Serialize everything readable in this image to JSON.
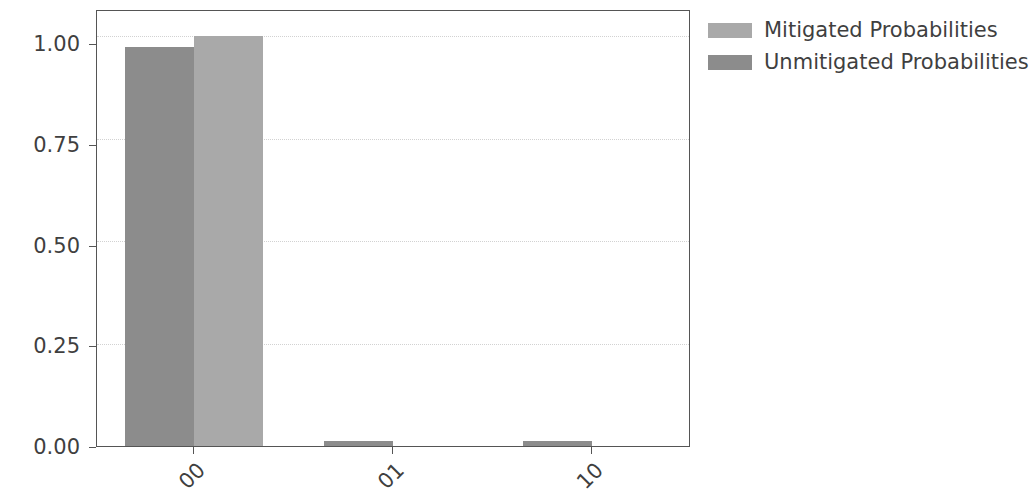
{
  "chart": {
    "ylabel": "Quasi-probability",
    "xlabel": "",
    "title": ""
  },
  "axis": {
    "yticks": [
      "0.00",
      "0.25",
      "0.50",
      "0.75",
      "1.00"
    ],
    "xticks": [
      "00",
      "01",
      "10"
    ]
  },
  "legend": {
    "entries": [
      {
        "label": "Mitigated Probabilities",
        "color": "#a9a9a9"
      },
      {
        "label": "Unmitigated Probabilities",
        "color": "#8c8c8c"
      }
    ]
  },
  "chart_data": {
    "type": "bar",
    "title": "",
    "xlabel": "",
    "ylabel": "Quasi-probability",
    "categories": [
      "00",
      "01",
      "10"
    ],
    "series": [
      {
        "name": "Unmitigated Probabilities",
        "color": "#8c8c8c",
        "values": [
          0.975,
          0.012,
          0.012
        ]
      },
      {
        "name": "Mitigated Probabilities",
        "color": "#a9a9a9",
        "values": [
          1.0,
          0.0,
          0.0
        ]
      }
    ],
    "ylim": [
      0.0,
      1.062
    ],
    "yticks": [
      0.0,
      0.25,
      0.5,
      0.75,
      1.0
    ],
    "grid": "y-axis dotted light gray",
    "legend_position": "upper right, outside axes",
    "xtick_rotation": -45,
    "bar_order": "unmitigated drawn left of mitigated within each group"
  }
}
